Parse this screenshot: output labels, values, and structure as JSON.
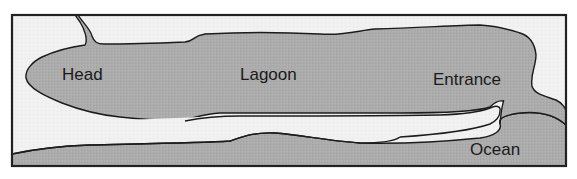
{
  "diagram": {
    "type": "lagoon-schematic",
    "colors": {
      "land": "#f0f0f0",
      "water": "#aaaaaa",
      "outline": "#1c1c1c",
      "frame": "#222222"
    },
    "labels": {
      "head": "Head",
      "lagoon": "Lagoon",
      "entrance": "Entrance",
      "ocean": "Ocean"
    }
  }
}
